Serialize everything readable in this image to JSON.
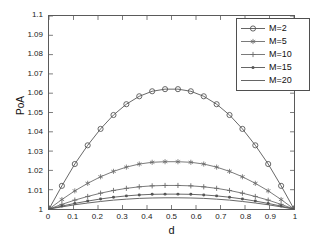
{
  "chart_data": {
    "type": "line",
    "title": "",
    "xlabel": "d",
    "ylabel": "PoA",
    "xlim": [
      0,
      1
    ],
    "ylim": [
      1,
      1.1
    ],
    "grid": false,
    "legend_position": "upper-right",
    "x_ticks": [
      "0",
      "0.1",
      "0.2",
      "0.3",
      "0.4",
      "0.5",
      "0.6",
      "0.7",
      "0.8",
      "0.9",
      "1"
    ],
    "x_tick_values": [
      0,
      0.1,
      0.2,
      0.3,
      0.4,
      0.5,
      0.6,
      0.7,
      0.8,
      0.9,
      1
    ],
    "y_ticks": [
      "1",
      "1.01",
      "1.02",
      "1.03",
      "1.04",
      "1.05",
      "1.06",
      "1.07",
      "1.08",
      "1.09",
      "1.1"
    ],
    "y_tick_values": [
      1,
      1.01,
      1.02,
      1.03,
      1.04,
      1.05,
      1.06,
      1.07,
      1.08,
      1.09,
      1.1
    ],
    "x": [
      0,
      0.0526,
      0.1053,
      0.1579,
      0.2105,
      0.2632,
      0.3158,
      0.3684,
      0.4211,
      0.4737,
      0.5263,
      0.5789,
      0.6316,
      0.6842,
      0.7368,
      0.7895,
      0.8421,
      0.8947,
      0.9474,
      1
    ],
    "series": [
      {
        "name": "M=2",
        "marker": "circle",
        "color": "#555555",
        "values": [
          1.0,
          1.012,
          1.0233,
          1.033,
          1.0415,
          1.0487,
          1.0543,
          1.0584,
          1.061,
          1.0621,
          1.0621,
          1.061,
          1.0584,
          1.0543,
          1.0487,
          1.0415,
          1.033,
          1.0233,
          1.012,
          1.0
        ]
      },
      {
        "name": "M=5",
        "marker": "star",
        "color": "#6b6b6b",
        "values": [
          1.0,
          1.0049,
          1.0094,
          1.0133,
          1.0167,
          1.0195,
          1.0217,
          1.0233,
          1.0242,
          1.0245,
          1.0245,
          1.0242,
          1.0233,
          1.0217,
          1.0195,
          1.0167,
          1.0133,
          1.0094,
          1.0049,
          1.0
        ]
      },
      {
        "name": "M=10",
        "marker": "plus",
        "color": "#6b6b6b",
        "values": [
          1.0,
          1.0024,
          1.0046,
          1.0065,
          1.0082,
          1.0096,
          1.0107,
          1.0115,
          1.012,
          1.0122,
          1.0122,
          1.012,
          1.0115,
          1.0107,
          1.0096,
          1.0082,
          1.0065,
          1.0046,
          1.0024,
          1.0
        ]
      },
      {
        "name": "M=15",
        "marker": "dot",
        "color": "#555555",
        "values": [
          1.0,
          1.0015,
          1.0029,
          1.0041,
          1.0052,
          1.0061,
          1.0068,
          1.0073,
          1.0076,
          1.0077,
          1.0077,
          1.0076,
          1.0073,
          1.0068,
          1.0061,
          1.0052,
          1.0041,
          1.0029,
          1.0015,
          1.0
        ]
      },
      {
        "name": "M=20",
        "marker": "none",
        "color": "#555555",
        "values": [
          1.0,
          1.0011,
          1.0022,
          1.0031,
          1.0039,
          1.0046,
          1.0051,
          1.0055,
          1.0057,
          1.0058,
          1.0058,
          1.0057,
          1.0055,
          1.0051,
          1.0046,
          1.0039,
          1.0031,
          1.0022,
          1.0011,
          1.0
        ]
      }
    ]
  },
  "axes": {
    "y_title": "PoA",
    "x_title": "d"
  },
  "legend": {
    "items": [
      {
        "label": "M=2"
      },
      {
        "label": "M=5"
      },
      {
        "label": "M=10"
      },
      {
        "label": "M=15"
      },
      {
        "label": "M=20"
      }
    ]
  },
  "colors": {
    "axis": "#5a5a5a",
    "text": "#1a1a1a",
    "background": "#ffffff"
  }
}
